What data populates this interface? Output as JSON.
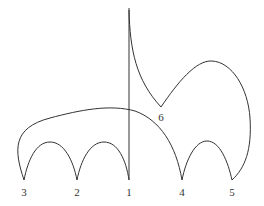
{
  "diagram": {
    "type": "curve-diagram",
    "stroke_color": "#333333",
    "background": "#ffffff",
    "nodes": [
      {
        "id": "3",
        "label": "3",
        "x": 24,
        "y": 180
      },
      {
        "id": "2",
        "label": "2",
        "x": 77,
        "y": 180
      },
      {
        "id": "1",
        "label": "1",
        "x": 129,
        "y": 180
      },
      {
        "id": "4",
        "label": "4",
        "x": 182,
        "y": 180
      },
      {
        "id": "5",
        "label": "5",
        "x": 232,
        "y": 180
      },
      {
        "id": "6",
        "label": "6",
        "x": 161,
        "y": 107
      }
    ],
    "edges": [
      {
        "from": "3",
        "to": "2",
        "shape": "arch"
      },
      {
        "from": "2",
        "to": "1",
        "shape": "arch"
      },
      {
        "from": "4",
        "to": "5",
        "shape": "arch"
      },
      {
        "from": "3",
        "to": "4",
        "shape": "large-arch"
      },
      {
        "from": "6",
        "to": "5",
        "shape": "loop"
      },
      {
        "from": "top",
        "to": "6",
        "shape": "cusp-curve"
      },
      {
        "from": "top",
        "to": "1",
        "shape": "vertical-line"
      }
    ]
  },
  "labels": {
    "n1": "1",
    "n2": "2",
    "n3": "3",
    "n4": "4",
    "n5": "5",
    "n6": "6"
  }
}
